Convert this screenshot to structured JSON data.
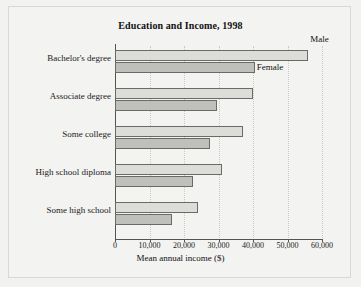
{
  "chart_data": {
    "type": "bar",
    "orientation": "horizontal",
    "title": "Education and Income, 1998",
    "xlabel": "Mean annual income ($)",
    "ylabel": "",
    "categories": [
      "Bachelor's degree",
      "Associate degree",
      "Some college",
      "High school diploma",
      "Some high school"
    ],
    "series": [
      {
        "name": "Male",
        "values": [
          56000,
          40000,
          37000,
          31000,
          24000
        ],
        "color": "#dcdcd8"
      },
      {
        "name": "Female",
        "values": [
          40500,
          29500,
          27500,
          22500,
          16500
        ],
        "color": "#bfbfbb"
      }
    ],
    "xlim": [
      0,
      60000
    ],
    "xticks": [
      0,
      10000,
      20000,
      30000,
      40000,
      50000,
      60000
    ],
    "xtick_labels": [
      "0",
      "10,000",
      "20,000",
      "30,000",
      "40,000",
      "50,000",
      "60,000"
    ],
    "grid": "vertical-dotted",
    "legend_position": "inline-annotations",
    "annotations": [
      {
        "text": "Male",
        "series": "Male",
        "category": "Bachelor's degree"
      },
      {
        "text": "Female",
        "series": "Female",
        "category": "Bachelor's degree"
      }
    ]
  }
}
